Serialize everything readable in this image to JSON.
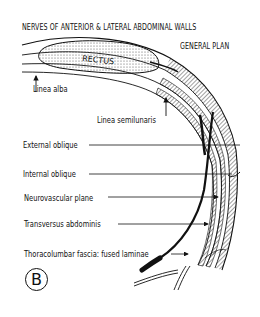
{
  "diagram": {
    "title": "NERVES OF ANTERIOR & LATERAL ABDOMINAL WALLS",
    "subtitle": "GENERAL PLAN",
    "panel_letter": "B",
    "structure_text": "RECTUS",
    "labels": [
      {
        "id": "linea-alba",
        "text": "Linea alba"
      },
      {
        "id": "linea-semilunaris",
        "text": "Linea semilunaris"
      },
      {
        "id": "external-oblique",
        "text": "External oblique"
      },
      {
        "id": "internal-oblique",
        "text": "Internal oblique"
      },
      {
        "id": "neurovascular-plane",
        "text": "Neurovascular plane"
      },
      {
        "id": "transversus-abdominis",
        "text": "Transversus abdominis"
      },
      {
        "id": "thoracolumbar-fascia",
        "text": "Thoracolumbar fascia: fused laminae"
      }
    ],
    "colors": {
      "ink": "#111111",
      "background": "#ffffff"
    }
  }
}
